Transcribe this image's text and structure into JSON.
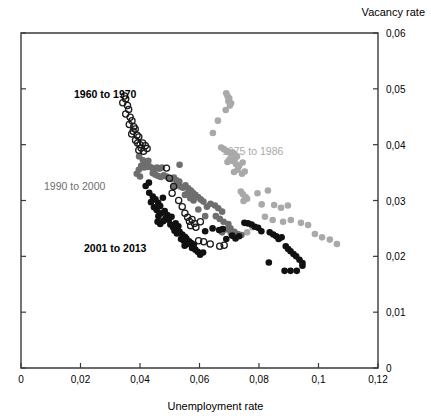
{
  "chart_data": {
    "type": "scatter",
    "title": "",
    "xlabel": "Unemployment rate",
    "ylabel": "Vacancy rate",
    "xlim": [
      0,
      0.12
    ],
    "ylim": [
      0,
      0.06
    ],
    "xticks": [
      "0",
      "0,02",
      "0,04",
      "0,06",
      "0,08",
      "0,1",
      "0,12"
    ],
    "xtick_values": [
      0,
      0.02,
      0.04,
      0.06,
      0.08,
      0.1,
      0.12
    ],
    "yticks": [
      "0",
      "0,01",
      "0,02",
      "0,03",
      "0,04",
      "0,05",
      "0,06"
    ],
    "ytick_values": [
      0,
      0.01,
      0.02,
      0.03,
      0.04,
      0.05,
      0.06
    ],
    "grid": false,
    "legend_position": "inline-annotations",
    "y_axis_side": "right",
    "annotations": [
      {
        "name": "1960 to 1970",
        "text": "1960 to 1970",
        "x_px": 74,
        "y_px": 88,
        "color": "#000000",
        "bold": true
      },
      {
        "name": "1975 to 1986",
        "text": "1975 to 1986",
        "x_px": 222,
        "y_px": 145,
        "color": "#a9a9a9",
        "bold": false
      },
      {
        "name": "1990 to 2000",
        "text": "1990 to 2000",
        "x_px": 44,
        "y_px": 180,
        "color": "#6e6e6e",
        "bold": false
      },
      {
        "name": "2001 to 2013",
        "text": "2001 to 2013",
        "x_px": 84,
        "y_px": 242,
        "color": "#000000",
        "bold": true
      }
    ],
    "series": [
      {
        "name": "1960 to 1970",
        "marker": "open-circle",
        "color": "#1a1a1a",
        "fill": "none",
        "radius": 3.1,
        "points": [
          [
            0.0348,
            0.0487
          ],
          [
            0.0352,
            0.0482
          ],
          [
            0.0342,
            0.0475
          ],
          [
            0.0358,
            0.047
          ],
          [
            0.0362,
            0.0463
          ],
          [
            0.0352,
            0.0455
          ],
          [
            0.0367,
            0.0449
          ],
          [
            0.0373,
            0.0443
          ],
          [
            0.0364,
            0.0436
          ],
          [
            0.0379,
            0.0432
          ],
          [
            0.0384,
            0.0428
          ],
          [
            0.0377,
            0.0424
          ],
          [
            0.0372,
            0.0419
          ],
          [
            0.039,
            0.0417
          ],
          [
            0.0396,
            0.0414
          ],
          [
            0.0385,
            0.0408
          ],
          [
            0.0392,
            0.0403
          ],
          [
            0.04,
            0.04
          ],
          [
            0.0409,
            0.0403
          ],
          [
            0.0418,
            0.0398
          ],
          [
            0.0404,
            0.0394
          ],
          [
            0.0396,
            0.039
          ],
          [
            0.0412,
            0.0388
          ],
          [
            0.0424,
            0.0393
          ],
          [
            0.0489,
            0.0358
          ],
          [
            0.0499,
            0.034
          ],
          [
            0.0513,
            0.0325
          ],
          [
            0.0508,
            0.0313
          ],
          [
            0.053,
            0.03
          ],
          [
            0.0542,
            0.0289
          ],
          [
            0.0551,
            0.0277
          ],
          [
            0.056,
            0.027
          ],
          [
            0.0566,
            0.0263
          ],
          [
            0.0575,
            0.0266
          ],
          [
            0.0583,
            0.0259
          ],
          [
            0.057,
            0.0255
          ],
          [
            0.0588,
            0.0252
          ],
          [
            0.0603,
            0.0262
          ],
          [
            0.0597,
            0.0228
          ],
          [
            0.0614,
            0.0226
          ],
          [
            0.0636,
            0.0222
          ],
          [
            0.0668,
            0.0218
          ],
          [
            0.0683,
            0.022
          ]
        ]
      },
      {
        "name": "1975 to 1986",
        "marker": "filled-circle",
        "color": "#a9a9a9",
        "radius": 3.3,
        "points": [
          [
            0.069,
            0.0492
          ],
          [
            0.0694,
            0.0487
          ],
          [
            0.07,
            0.0483
          ],
          [
            0.0697,
            0.0478
          ],
          [
            0.0706,
            0.0474
          ],
          [
            0.0702,
            0.047
          ],
          [
            0.0688,
            0.0462
          ],
          [
            0.0662,
            0.0443
          ],
          [
            0.0645,
            0.0421
          ],
          [
            0.0673,
            0.0395
          ],
          [
            0.0682,
            0.0392
          ],
          [
            0.069,
            0.0389
          ],
          [
            0.0698,
            0.0387
          ],
          [
            0.0705,
            0.0384
          ],
          [
            0.0712,
            0.0386
          ],
          [
            0.0719,
            0.0382
          ],
          [
            0.0726,
            0.0379
          ],
          [
            0.0718,
            0.0374
          ],
          [
            0.071,
            0.0371
          ],
          [
            0.0701,
            0.0374
          ],
          [
            0.0694,
            0.0369
          ],
          [
            0.0723,
            0.0365
          ],
          [
            0.0733,
            0.0362
          ],
          [
            0.0745,
            0.0368
          ],
          [
            0.0728,
            0.0355
          ],
          [
            0.0716,
            0.0351
          ],
          [
            0.0743,
            0.0348
          ],
          [
            0.0752,
            0.0352
          ],
          [
            0.0739,
            0.0316
          ],
          [
            0.0746,
            0.0311
          ],
          [
            0.0755,
            0.0306
          ],
          [
            0.0748,
            0.0299
          ],
          [
            0.076,
            0.0303
          ],
          [
            0.0795,
            0.0313
          ],
          [
            0.083,
            0.0318
          ],
          [
            0.0809,
            0.0293
          ],
          [
            0.0851,
            0.0292
          ],
          [
            0.0874,
            0.0287
          ],
          [
            0.0897,
            0.0291
          ],
          [
            0.082,
            0.0271
          ],
          [
            0.0846,
            0.0265
          ],
          [
            0.0881,
            0.0262
          ],
          [
            0.0907,
            0.0265
          ],
          [
            0.0941,
            0.026
          ],
          [
            0.0965,
            0.0256
          ],
          [
            0.0988,
            0.024
          ],
          [
            0.1012,
            0.0234
          ],
          [
            0.1038,
            0.023
          ],
          [
            0.1062,
            0.0222
          ],
          [
            0.0778,
            0.0252
          ],
          [
            0.076,
            0.0243
          ]
        ]
      },
      {
        "name": "1990 to 2000",
        "marker": "filled-circle",
        "color": "#6e6e6e",
        "radius": 3.3,
        "points": [
          [
            0.0397,
            0.0379
          ],
          [
            0.041,
            0.0372
          ],
          [
            0.0419,
            0.0368
          ],
          [
            0.0428,
            0.0371
          ],
          [
            0.0404,
            0.0362
          ],
          [
            0.0396,
            0.0355
          ],
          [
            0.0389,
            0.0348
          ],
          [
            0.04,
            0.0343
          ],
          [
            0.0413,
            0.0359
          ],
          [
            0.0424,
            0.036
          ],
          [
            0.0433,
            0.0361
          ],
          [
            0.0441,
            0.0358
          ],
          [
            0.0449,
            0.0356
          ],
          [
            0.0457,
            0.0359
          ],
          [
            0.0465,
            0.0357
          ],
          [
            0.0474,
            0.0359
          ],
          [
            0.0443,
            0.0349
          ],
          [
            0.0452,
            0.0346
          ],
          [
            0.0461,
            0.0344
          ],
          [
            0.047,
            0.0342
          ],
          [
            0.048,
            0.0345
          ],
          [
            0.0489,
            0.0343
          ],
          [
            0.0497,
            0.034
          ],
          [
            0.0506,
            0.0338
          ],
          [
            0.0514,
            0.0341
          ],
          [
            0.0523,
            0.0336
          ],
          [
            0.0532,
            0.0334
          ],
          [
            0.0523,
            0.0328
          ],
          [
            0.0515,
            0.0326
          ],
          [
            0.0535,
            0.0325
          ],
          [
            0.0544,
            0.0323
          ],
          [
            0.0553,
            0.0327
          ],
          [
            0.0562,
            0.0322
          ],
          [
            0.0571,
            0.0318
          ],
          [
            0.056,
            0.0313
          ],
          [
            0.0551,
            0.031
          ],
          [
            0.0578,
            0.0314
          ],
          [
            0.0586,
            0.031
          ],
          [
            0.0595,
            0.0306
          ],
          [
            0.0604,
            0.0302
          ],
          [
            0.0533,
            0.0364
          ],
          [
            0.0613,
            0.0298
          ],
          [
            0.0569,
            0.0304
          ],
          [
            0.058,
            0.03
          ],
          [
            0.0625,
            0.0289
          ],
          [
            0.0637,
            0.0294
          ],
          [
            0.0652,
            0.0291
          ],
          [
            0.0663,
            0.0286
          ],
          [
            0.0676,
            0.028
          ],
          [
            0.0655,
            0.0272
          ],
          [
            0.0668,
            0.0267
          ],
          [
            0.0681,
            0.0262
          ],
          [
            0.0697,
            0.0258
          ],
          [
            0.0688,
            0.0248
          ],
          [
            0.0676,
            0.0243
          ],
          [
            0.0705,
            0.0242
          ],
          [
            0.0717,
            0.0244
          ],
          [
            0.0729,
            0.024
          ],
          [
            0.0741,
            0.0238
          ],
          [
            0.0704,
            0.025
          ],
          [
            0.0596,
            0.0284
          ],
          [
            0.0619,
            0.0272
          ]
        ]
      },
      {
        "name": "2001 to 2013",
        "marker": "filled-circle",
        "color": "#111111",
        "radius": 3.3,
        "points": [
          [
            0.0419,
            0.0326
          ],
          [
            0.0431,
            0.0314
          ],
          [
            0.0443,
            0.0307
          ],
          [
            0.0437,
            0.0297
          ],
          [
            0.0452,
            0.0302
          ],
          [
            0.0461,
            0.0296
          ],
          [
            0.0447,
            0.0288
          ],
          [
            0.0456,
            0.0283
          ],
          [
            0.0468,
            0.029
          ],
          [
            0.0477,
            0.0305
          ],
          [
            0.0471,
            0.0277
          ],
          [
            0.0462,
            0.0272
          ],
          [
            0.0483,
            0.0281
          ],
          [
            0.0492,
            0.0274
          ],
          [
            0.0486,
            0.0268
          ],
          [
            0.0478,
            0.0263
          ],
          [
            0.0497,
            0.0265
          ],
          [
            0.0506,
            0.0271
          ],
          [
            0.0468,
            0.0258
          ],
          [
            0.0459,
            0.0262
          ],
          [
            0.0502,
            0.0257
          ],
          [
            0.0511,
            0.0252
          ],
          [
            0.052,
            0.0259
          ],
          [
            0.0529,
            0.0254
          ],
          [
            0.0516,
            0.0246
          ],
          [
            0.0524,
            0.0241
          ],
          [
            0.0533,
            0.0244
          ],
          [
            0.0542,
            0.0239
          ],
          [
            0.0551,
            0.0235
          ],
          [
            0.0538,
            0.0231
          ],
          [
            0.0547,
            0.0228
          ],
          [
            0.0556,
            0.0232
          ],
          [
            0.0565,
            0.0227
          ],
          [
            0.0559,
            0.0222
          ],
          [
            0.055,
            0.0219
          ],
          [
            0.0572,
            0.0224
          ],
          [
            0.0581,
            0.0221
          ],
          [
            0.0575,
            0.0215
          ],
          [
            0.0586,
            0.0212
          ],
          [
            0.0594,
            0.0208
          ],
          [
            0.0602,
            0.0203
          ],
          [
            0.0612,
            0.0207
          ],
          [
            0.0619,
            0.0245
          ],
          [
            0.0644,
            0.025
          ],
          [
            0.0666,
            0.0247
          ],
          [
            0.0678,
            0.0249
          ],
          [
            0.0751,
            0.026
          ],
          [
            0.0763,
            0.0259
          ],
          [
            0.0775,
            0.0257
          ],
          [
            0.0786,
            0.0253
          ],
          [
            0.0797,
            0.0251
          ],
          [
            0.0808,
            0.0245
          ],
          [
            0.0836,
            0.0243
          ],
          [
            0.0848,
            0.0239
          ],
          [
            0.0858,
            0.0236
          ],
          [
            0.0866,
            0.0231
          ],
          [
            0.0876,
            0.0234
          ],
          [
            0.089,
            0.0218
          ],
          [
            0.0898,
            0.0213
          ],
          [
            0.0906,
            0.0209
          ],
          [
            0.0916,
            0.0204
          ],
          [
            0.0925,
            0.02
          ],
          [
            0.0936,
            0.0194
          ],
          [
            0.0946,
            0.0188
          ],
          [
            0.0833,
            0.0189
          ],
          [
            0.0886,
            0.0174
          ],
          [
            0.0906,
            0.0174
          ],
          [
            0.0927,
            0.0174
          ],
          [
            0.0946,
            0.0183
          ],
          [
            0.071,
            0.0237
          ],
          [
            0.0721,
            0.0232
          ],
          [
            0.0733,
            0.0236
          ],
          [
            0.069,
            0.0231
          ],
          [
            0.043,
            0.0332
          ]
        ]
      }
    ]
  },
  "plot_geometry": {
    "left_px": 21,
    "right_px": 378,
    "top_px": 33,
    "bottom_px": 368
  }
}
